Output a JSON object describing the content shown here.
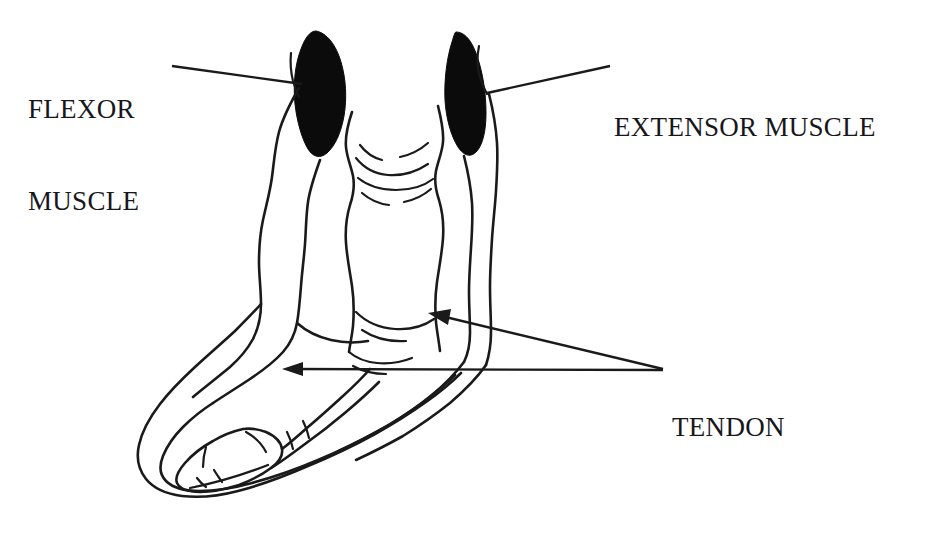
{
  "figure": {
    "background_color": "#ffffff",
    "stroke_color": "#1a1a1a",
    "muscle_fill_color": "#0b0b0b",
    "width": 940,
    "height": 547
  },
  "labels": {
    "flexor": {
      "line1": "FLEXOR",
      "line2": "MUSCLE",
      "full": "FLEXOR MUSCLE"
    },
    "extensor": {
      "line1": "EXTENSOR MUSCLE",
      "full": "EXTENSOR MUSCLE"
    },
    "tendon": {
      "line1": "TENDON",
      "full": "TENDON"
    }
  },
  "annotations": {
    "flexor_leader": {
      "from_x": 172,
      "from_y": 66,
      "to_x": 300,
      "to_y": 82,
      "has_arrowhead": false
    },
    "extensor_leader": {
      "from_x": 610,
      "from_y": 66,
      "to_x": 489,
      "to_y": 93,
      "has_arrowhead": false
    },
    "tendon_arrow_upper": {
      "from_x": 663,
      "from_y": 369,
      "to_x": 430,
      "to_y": 313,
      "has_arrowhead": true
    },
    "tendon_arrow_lower": {
      "from_x": 663,
      "from_y": 370,
      "to_x": 283,
      "to_y": 369,
      "has_arrowhead": true
    }
  },
  "structures": {
    "flexor_muscle_belly": "black teardrop-shaped muscle belly, left side",
    "extensor_muscle_belly": "black teardrop-shaped muscle belly, right side",
    "flexor_tendon": "long paired tendon running down the front of the limb into the toe",
    "extensor_tendon": "long paired tendon running down the back of the limb into the heel",
    "cannon_bone": "central long bone with joint outlines",
    "hoof": "outer hoof/foot outline with inner phalanx bones"
  }
}
